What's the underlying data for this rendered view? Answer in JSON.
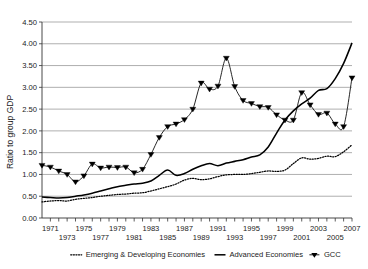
{
  "chart_data": {
    "type": "line",
    "title": "",
    "xlabel": "",
    "ylabel": "Ratio to group GDP",
    "xlim": [
      1970,
      2007
    ],
    "ylim": [
      0.0,
      4.5
    ],
    "grid": true,
    "legend_position": "bottom",
    "y_ticks": [
      "0.00",
      "0.50",
      "1.00",
      "1.50",
      "2.00",
      "2.50",
      "3.00",
      "3.50",
      "4.00",
      "4.50"
    ],
    "y_tick_values": [
      0.0,
      0.5,
      1.0,
      1.5,
      2.0,
      2.5,
      3.0,
      3.5,
      4.0,
      4.5
    ],
    "x_ticks_top": [
      "1971",
      "1975",
      "1979",
      "1983",
      "1987",
      "1991",
      "1995",
      "1999",
      "2003",
      "2007"
    ],
    "x_ticks_bottom": [
      "1973",
      "1977",
      "1981",
      "1985",
      "1989",
      "1993",
      "1997",
      "2001",
      "2005"
    ],
    "x": [
      1970,
      1971,
      1972,
      1973,
      1974,
      1975,
      1976,
      1977,
      1978,
      1979,
      1980,
      1981,
      1982,
      1983,
      1984,
      1985,
      1986,
      1987,
      1988,
      1989,
      1990,
      1991,
      1992,
      1993,
      1994,
      1995,
      1996,
      1997,
      1998,
      1999,
      2000,
      2001,
      2002,
      2003,
      2004,
      2005,
      2006,
      2007
    ],
    "series": [
      {
        "name": "Emerging & Developing Economies",
        "style": "dotted",
        "marker": "none",
        "color": "#000000",
        "values": [
          0.37,
          0.39,
          0.4,
          0.39,
          0.43,
          0.45,
          0.47,
          0.5,
          0.52,
          0.54,
          0.55,
          0.57,
          0.58,
          0.62,
          0.67,
          0.72,
          0.78,
          0.87,
          0.91,
          0.88,
          0.9,
          0.95,
          0.99,
          1.0,
          1.0,
          1.02,
          1.05,
          1.08,
          1.07,
          1.1,
          1.25,
          1.38,
          1.35,
          1.37,
          1.42,
          1.41,
          1.52,
          1.68
        ]
      },
      {
        "name": "Advanced Economies",
        "style": "solid",
        "marker": "none",
        "color": "#000000",
        "values": [
          0.48,
          0.47,
          0.46,
          0.47,
          0.5,
          0.53,
          0.57,
          0.62,
          0.67,
          0.72,
          0.75,
          0.78,
          0.8,
          0.85,
          0.98,
          1.1,
          0.98,
          1.02,
          1.12,
          1.2,
          1.25,
          1.2,
          1.26,
          1.3,
          1.34,
          1.4,
          1.45,
          1.63,
          1.95,
          2.25,
          2.46,
          2.62,
          2.75,
          2.93,
          2.97,
          3.2,
          3.55,
          4.02
        ]
      },
      {
        "name": "GCC",
        "style": "solid-marker",
        "marker": "triangle-down",
        "color": "#000000",
        "values": [
          1.21,
          1.17,
          1.08,
          1.0,
          0.83,
          0.97,
          1.24,
          1.15,
          1.17,
          1.16,
          1.17,
          1.04,
          1.12,
          1.46,
          1.85,
          2.1,
          2.16,
          2.26,
          2.5,
          3.1,
          2.96,
          3.03,
          3.67,
          3.02,
          2.7,
          2.63,
          2.56,
          2.54,
          2.37,
          2.25,
          2.25,
          2.88,
          2.6,
          2.38,
          2.41,
          2.16,
          2.1,
          3.22
        ]
      }
    ],
    "gcc_x": [
      1970,
      1971,
      1972,
      1973,
      1974,
      1975,
      1976,
      1977,
      1978,
      1979,
      1980,
      1981,
      1982,
      1983,
      1984,
      1985,
      1986,
      1987,
      1988,
      1989,
      1990,
      1991,
      1992,
      1993,
      1994,
      1995,
      1996,
      1997,
      1998,
      1999,
      2000,
      2001,
      2002,
      2003,
      2004,
      2005,
      2006,
      2007
    ]
  },
  "legend": {
    "items": [
      {
        "label": "Emerging & Developing Economies",
        "marker": "dotted-line"
      },
      {
        "label": "Advanced Economies",
        "marker": "solid-line"
      },
      {
        "label": "GCC",
        "marker": "triangle-down"
      }
    ]
  },
  "axes": {
    "y_title": "Ratio to group GDP"
  }
}
